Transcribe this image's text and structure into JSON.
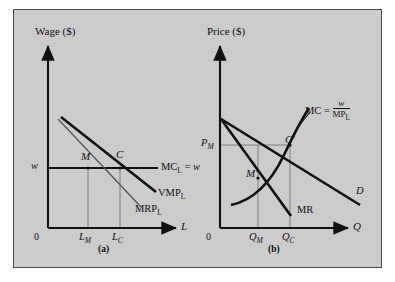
{
  "figure": {
    "background_color": "#cccccc",
    "border_color": "#4a4a4a",
    "line_color": "#111111",
    "guide_color": "#777777"
  },
  "panel_a": {
    "caption": "(a)",
    "y_axis_title": "Wage ($)",
    "x_axis_title": "L",
    "origin_label": "0",
    "y_tick_label": "w",
    "x_tick_labels": [
      "L",
      "L"
    ],
    "x_tick_subscripts": [
      "M",
      "C"
    ],
    "curves": [
      {
        "name": "VMP_L",
        "label_main": "VMP",
        "label_sub": "L",
        "style": "thick"
      },
      {
        "name": "MRP_L",
        "label_main": "MRP",
        "label_sub": "L",
        "style": "thin"
      },
      {
        "name": "MC_L = w",
        "label_main": "MC",
        "label_sub": "L",
        "label_tail": " = ",
        "label_tail_italic": "w",
        "style": "thick-horizontal"
      }
    ],
    "points": [
      {
        "label": "M",
        "meaning": "monopsony-employment-point"
      },
      {
        "label": "C",
        "meaning": "competitive-employment-point"
      }
    ]
  },
  "panel_b": {
    "caption": "(b)",
    "y_axis_title": "Price ($)",
    "x_axis_title": "Q",
    "origin_label": "0",
    "y_tick_label": "P",
    "y_tick_subscript": "M",
    "x_tick_labels": [
      "Q",
      "Q"
    ],
    "x_tick_subscripts": [
      "M",
      "C"
    ],
    "curves": [
      {
        "name": "D",
        "label_main": "D",
        "style": "thick"
      },
      {
        "name": "MR",
        "label_main": "MR",
        "style": "thick"
      },
      {
        "name": "MC",
        "label_main": "MC",
        "label_eq": " = ",
        "numerator": "w",
        "denominator_main": "MP",
        "denominator_sub": "L",
        "style": "thick-curve"
      }
    ],
    "points": [
      {
        "label": "M′",
        "meaning": "monopoly-output-point"
      },
      {
        "label": "C′",
        "meaning": "competitive-output-point"
      }
    ]
  }
}
